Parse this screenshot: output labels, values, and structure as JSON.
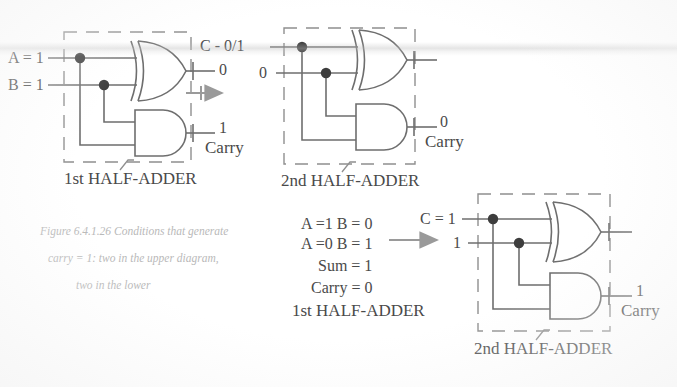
{
  "figure": {
    "caption_lines": [
      "Figure 6.4.1.26 Conditions that generate",
      "carry = 1: two in the upper diagram,",
      "two in the lower"
    ]
  },
  "colors": {
    "ink": "#4a4a4a",
    "wire": "#6e6e6e",
    "dashed_box": "#8a8a8a",
    "node_dot": "#3d3d3d",
    "arrow": "#9a9a9a",
    "caption": "#b9b9b9",
    "background": "#ffffff"
  },
  "upper_row": {
    "first_half_adder": {
      "box_label": "1st HALF-ADDER",
      "inputs": [
        {
          "label": "A = 1"
        },
        {
          "label": "B = 1"
        }
      ],
      "xor_output": {
        "label": "0"
      },
      "and_output": {
        "value": "1",
        "name": "Carry"
      }
    },
    "arrow": {
      "name": "flow-arrow-right"
    },
    "second_half_adder": {
      "box_label": "2nd HALF-ADDER",
      "inputs": [
        {
          "label": "C - 0/1"
        },
        {
          "label": "0"
        }
      ],
      "xor_output": {
        "label": ""
      },
      "and_output": {
        "value": "0",
        "name": "Carry"
      }
    }
  },
  "lower_row": {
    "conditions": {
      "lines": [
        "A =1 B = 0",
        "A =0 B = 1",
        "Sum = 1",
        "Carry = 0"
      ],
      "caption": "1st HALF-ADDER"
    },
    "arrow": {
      "name": "flow-arrow-right"
    },
    "second_half_adder": {
      "box_label": "2nd HALF-ADDER",
      "inputs": [
        {
          "label": "C = 1"
        },
        {
          "label": "1"
        }
      ],
      "xor_output": {
        "label": ""
      },
      "and_output": {
        "value": "1",
        "name": "Carry"
      }
    }
  }
}
